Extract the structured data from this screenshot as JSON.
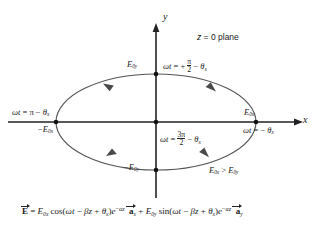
{
  "figure": {
    "title_note": "z = 0 plane",
    "inequality": "E0x > E0y",
    "axes": {
      "x_label": "x",
      "y_label": "y"
    },
    "amplitudes": {
      "pos_x": "E0x",
      "neg_x": "-E0x",
      "pos_y": "E0y",
      "neg_y": "-E0y"
    },
    "annotations": [
      {
        "name": "phase-top",
        "text": "wt = + pi/2 - theta_x"
      },
      {
        "name": "phase-left",
        "text": "wt = pi - theta_x"
      },
      {
        "name": "phase-right",
        "text": "wt = - theta_x"
      },
      {
        "name": "phase-bottom",
        "text": "wt = 3pi/2 - theta_x"
      }
    ],
    "equation": "E = E0x cos(wt - Bz + theta_x) e^(-alpha z) a_x + E0y sin(wt - Bz + theta_x) e^(-alpha z) a_y",
    "parts": {
      "omega_t": "ωt",
      "equals": "=",
      "plus": "+",
      "minus": "−",
      "pi": "π",
      "two": "2",
      "three_pi": "3π",
      "theta": "θ",
      "x_sub": "x",
      "y_sub": "y",
      "E": "E",
      "E_bold": "E",
      "zero_x": "0x",
      "zero_y": "0y",
      "gt": ">",
      "z_eq_0_plane": "z = 0 plane",
      "cos": "cos(",
      "sin": "sin(",
      "beta_z": "βz",
      "close_paren": ")",
      "e": "e",
      "alpha_z": "−αz",
      "a": "a",
      "z_italic": "z",
      "zero": "0"
    },
    "colors": {
      "ink": "#222222",
      "curve": "#4a4a4a",
      "background": "#ffffff"
    },
    "geometry": {
      "center_x": 156,
      "center_y": 122,
      "semi_major": 100,
      "semi_minor": 48,
      "rotation_sense": "counterclockwise"
    }
  }
}
